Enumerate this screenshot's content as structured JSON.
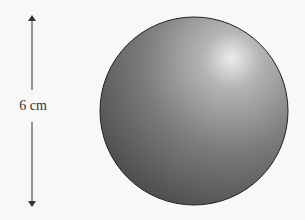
{
  "diagram": {
    "dimension_label": "6 cm",
    "dimension": "diameter",
    "colors": {
      "background": "#f8f8f6",
      "sphere_dark": "#4a4a4a",
      "sphere_mid": "#7a7a7a",
      "sphere_highlight": "#e8e8e8",
      "outline": "#222222",
      "arrow": "#333333"
    }
  }
}
